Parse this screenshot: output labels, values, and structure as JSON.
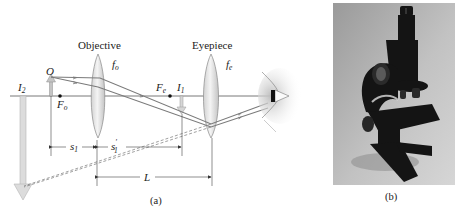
{
  "figure": {
    "panel_a": {
      "caption": "(a)",
      "labels": {
        "objective": "Objective",
        "eyepiece": "Eyepiece",
        "object": "O",
        "f_o": {
          "base": "f",
          "sub": "o"
        },
        "f_e": {
          "base": "f",
          "sub": "e"
        },
        "F_o": {
          "base": "F",
          "sub": "o"
        },
        "F_e": {
          "base": "F",
          "sub": "e"
        },
        "I_1": {
          "base": "I",
          "sub": "1"
        },
        "I_2": {
          "base": "I",
          "sub": "2"
        },
        "s_1": {
          "base": "s",
          "sub": "1"
        },
        "s_1_prime": {
          "base": "s",
          "sub": "1",
          "prime": "′"
        },
        "L": "L"
      },
      "colors": {
        "ray": "#7a7a7a",
        "axis": "#555555",
        "lens_fill": "#e6e6e6",
        "lens_stroke": "#8a8a8a",
        "image_arrow": "#d9d9d9",
        "object_arrow": "#bdbdbd"
      }
    },
    "panel_b": {
      "caption": "(b)",
      "photo": "compound-microscope-photo",
      "colors": {
        "background_light": "#c8c8c8",
        "background_dark": "#8f8f8f",
        "instrument": "#141414"
      }
    }
  }
}
